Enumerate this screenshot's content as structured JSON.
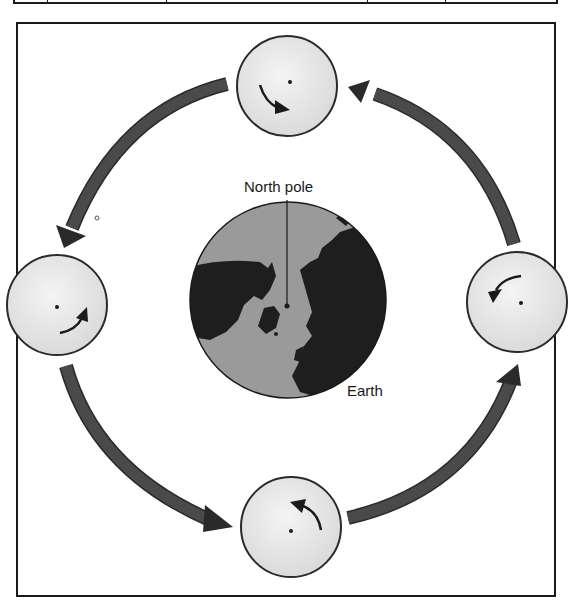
{
  "diagram": {
    "type": "moon-orbit-rotation",
    "labels": {
      "north_pole": "North pole",
      "earth": "Earth"
    },
    "colors": {
      "background": "#ffffff",
      "frame": "#1a1a1a",
      "orbit_arrow": "#3a3a3a",
      "earth_ocean": "#9a9a9a",
      "earth_land": "#1e1e1e",
      "moon_fill": "#e6e6e6",
      "moon_outline": "#2a2a2a"
    },
    "earth": {
      "cx": 288,
      "cy": 300,
      "r": 98,
      "north_pole_dot": {
        "cx": 286,
        "cy": 305
      }
    },
    "moons": [
      {
        "position": "top",
        "cx": 287,
        "cy": 86,
        "r": 50,
        "rotation_arrow": "clockwise-down"
      },
      {
        "position": "left",
        "cx": 57,
        "cy": 305,
        "r": 50,
        "rotation_arrow": "curving-up-right"
      },
      {
        "position": "bottom",
        "cx": 291,
        "cy": 527,
        "r": 50,
        "rotation_arrow": "curving-up-left"
      },
      {
        "position": "right",
        "cx": 517,
        "cy": 302,
        "r": 50,
        "rotation_arrow": "curving-down-left"
      }
    ],
    "orbit_direction": "counterclockwise",
    "orbit_arrows": [
      {
        "from": "top",
        "to": "left"
      },
      {
        "from": "left",
        "to": "bottom"
      },
      {
        "from": "bottom",
        "to": "right"
      },
      {
        "from": "right",
        "to": "top"
      }
    ]
  }
}
